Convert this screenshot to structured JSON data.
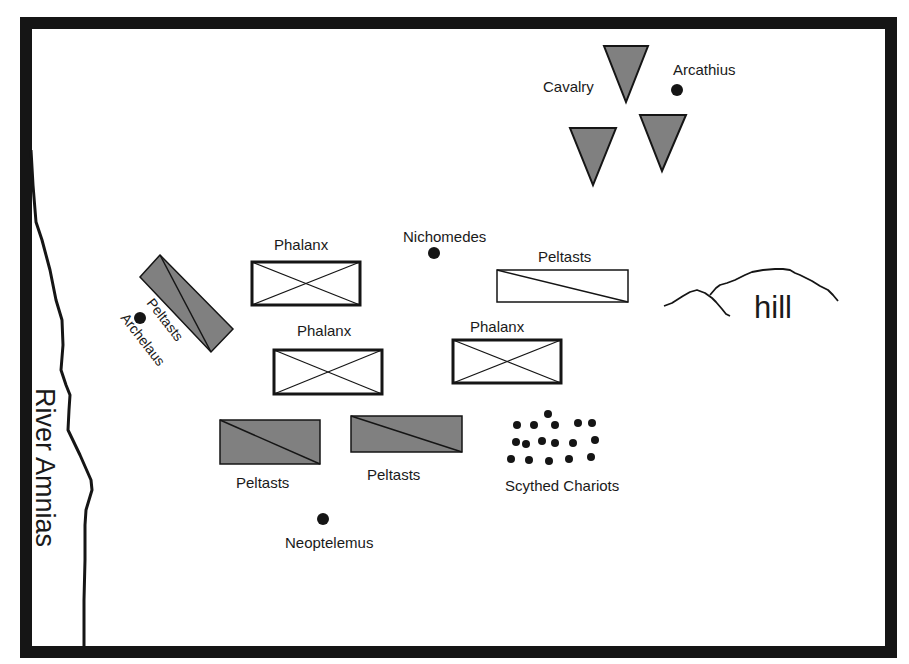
{
  "map": {
    "title": "Battle of the Amnias",
    "colors": {
      "border": "#151515",
      "unit_fill_gray": "#808080",
      "unit_fill_white": "#ffffff",
      "stroke": "#151515",
      "text": "#1a1a1a"
    },
    "river": {
      "label": "River Amnias"
    },
    "terrain": {
      "hill_label": "hill"
    },
    "commanders": [
      {
        "name": "Arcathius"
      },
      {
        "name": "Nichomedes"
      },
      {
        "name": "Archelaus"
      },
      {
        "name": "Neoptelemus"
      }
    ],
    "units": {
      "cavalry": {
        "label": "Cavalry",
        "count": 3
      },
      "phalanx": [
        {
          "label": "Phalanx"
        },
        {
          "label": "Phalanx"
        },
        {
          "label": "Phalanx"
        }
      ],
      "peltasts": [
        {
          "label": "Peltasts",
          "style": "white"
        },
        {
          "label": "Peltasts",
          "style": "gray-rotated"
        },
        {
          "label": "Peltasts",
          "style": "gray"
        },
        {
          "label": "Peltasts",
          "style": "gray"
        }
      ],
      "chariots": {
        "label": "Scythed Chariots",
        "count": 17
      }
    }
  }
}
